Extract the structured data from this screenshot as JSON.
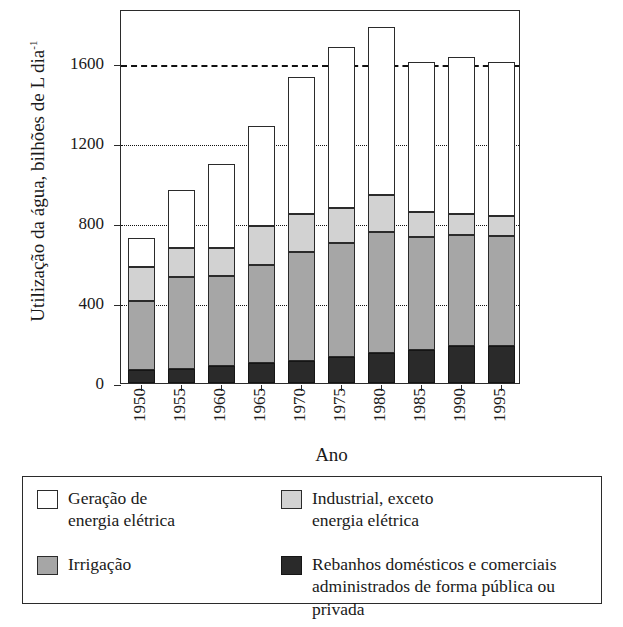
{
  "chart_data": {
    "type": "bar",
    "stacked": true,
    "title": "",
    "xlabel": "Ano",
    "ylabel": "Utilização da água, bilhões de L dia⁻¹",
    "ylabel_main": "Utilização da água, bilhões de L dia",
    "ylabel_exponent": "-1",
    "categories": [
      "1950",
      "1955",
      "1960",
      "1965",
      "1970",
      "1975",
      "1980",
      "1985",
      "1990",
      "1995"
    ],
    "ylim": [
      0,
      1870
    ],
    "yticks": [
      0,
      400,
      800,
      1200,
      1600
    ],
    "ytick_labels": [
      "0",
      "400",
      "800",
      "1200",
      "1600"
    ],
    "grid": "horizontal-dotted",
    "legend_position": "below-plot",
    "series": [
      {
        "name": "Rebanhos domésticos e comerciais administrados de forma pública ou privada",
        "color": "#2a2a2a",
        "values": [
          65,
          70,
          85,
          100,
          110,
          130,
          150,
          165,
          185,
          185
        ]
      },
      {
        "name": "Irrigação",
        "color": "#a6a6a6",
        "values": [
          345,
          460,
          450,
          490,
          545,
          570,
          605,
          565,
          555,
          550
        ]
      },
      {
        "name": "Industrial, exceto energia elétrica",
        "color": "#d2d2d2",
        "values": [
          170,
          145,
          140,
          195,
          190,
          175,
          185,
          125,
          105,
          100
        ]
      },
      {
        "name": "Geração de energia elétrica",
        "color": "#ffffff",
        "values": [
          145,
          290,
          420,
          500,
          685,
          805,
          840,
          750,
          785,
          770
        ]
      }
    ],
    "totals": [
      725,
      965,
      1095,
      1285,
      1530,
      1680,
      1780,
      1605,
      1630,
      1605
    ]
  },
  "legend": {
    "items": [
      {
        "swatch": "white",
        "line1": "Geração de",
        "line2": "energia elétrica"
      },
      {
        "swatch": "lightgray",
        "line1": "Industrial, exceto",
        "line2": "energia elétrica"
      },
      {
        "swatch": "midgray",
        "line1": "Irrigação",
        "line2": ""
      },
      {
        "swatch": "dark",
        "line1": "Rebanhos domésticos e comerciais",
        "line2": "administrados de forma pública ou privada"
      }
    ]
  }
}
